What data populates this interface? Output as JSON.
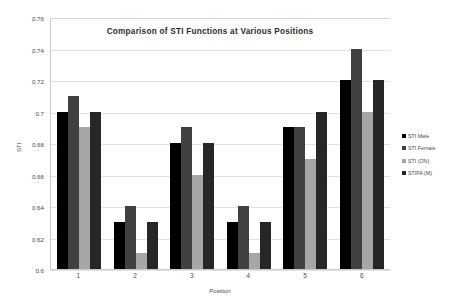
{
  "chart_data": {
    "type": "bar",
    "title": "Comparison of STI Functions at Various Positions",
    "xlabel": "Position",
    "ylabel": "STI",
    "categories": [
      "1",
      "2",
      "3",
      "4",
      "5",
      "6"
    ],
    "ylim": [
      0.6,
      0.76
    ],
    "yticks": [
      "0.6",
      "0.62",
      "0.64",
      "0.66",
      "0.68",
      "0.7",
      "0.72",
      "0.74",
      "0.76"
    ],
    "ytick_values": [
      0.6,
      0.62,
      0.64,
      0.66,
      0.68,
      0.7,
      0.72,
      0.74,
      0.76
    ],
    "grid": true,
    "legend_position": "right",
    "series": [
      {
        "name": "STI Male",
        "color": "#000000",
        "values": [
          0.7,
          0.63,
          0.68,
          0.63,
          0.69,
          0.72
        ]
      },
      {
        "name": "STI Female",
        "color": "#404040",
        "values": [
          0.71,
          0.64,
          0.69,
          0.64,
          0.69,
          0.74
        ]
      },
      {
        "name": "STI (ON)",
        "color": "#a6a6a6",
        "values": [
          0.69,
          0.61,
          0.66,
          0.61,
          0.67,
          0.7
        ]
      },
      {
        "name": "STIPA (M)",
        "color": "#262626",
        "values": [
          0.7,
          0.63,
          0.68,
          0.63,
          0.7,
          0.72
        ]
      }
    ]
  },
  "colors": {
    "background": "#ffffff",
    "grid": "#e2e2e2",
    "axis": "#c9c9c9",
    "text": "#4a4a4a",
    "title": "#2b2b2b"
  }
}
